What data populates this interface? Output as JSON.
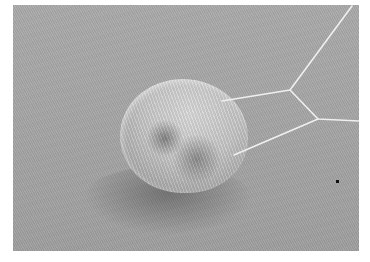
{
  "image": {
    "description": "Grayscale scanning-electron-micrograph style image of a fuzzy spherical particle resting on a flat textured surface, attached to thin bright filament lines forming a polygonal network",
    "subjects": [
      {
        "name": "fuzzy-sphere",
        "position": "center-left"
      },
      {
        "name": "filament-network",
        "position": "upper-right"
      },
      {
        "name": "small-dark-speck",
        "position": "lower-right"
      }
    ],
    "colors": {
      "background_margin": "#ffffff",
      "surface": "#a6a6a6",
      "sphere_highlight": "#dcdcdc",
      "filament": "#efefef",
      "speck": "#111111"
    }
  }
}
